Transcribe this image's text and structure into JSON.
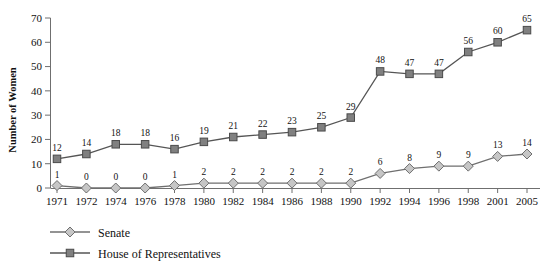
{
  "chart_data": {
    "type": "line",
    "title": "",
    "xlabel": "",
    "ylabel": "Number of Women",
    "ylim": [
      0,
      70
    ],
    "ytick_step": 10,
    "yticks": [
      "0",
      "10",
      "20",
      "30",
      "40",
      "50",
      "60",
      "70"
    ],
    "grid": false,
    "legend_position": "bottom-left",
    "categories": [
      "1971",
      "1972",
      "1974",
      "1976",
      "1978",
      "1980",
      "1982",
      "1984",
      "1986",
      "1988",
      "1990",
      "1992",
      "1994",
      "1996",
      "1998",
      "2001",
      "2005"
    ],
    "series": [
      {
        "name": "Senate",
        "marker": "diamond",
        "marker_fill": "#c6c6c6",
        "marker_stroke": "#6f6f6f",
        "line_color": "#6f6f6f",
        "values": [
          1,
          0,
          0,
          0,
          1,
          2,
          2,
          2,
          2,
          2,
          2,
          6,
          8,
          9,
          9,
          13,
          14
        ],
        "labels": [
          "1",
          "0",
          "0",
          "0",
          "1",
          "2",
          "2",
          "2",
          "2",
          "2",
          "2",
          "6",
          "8",
          "9",
          "9",
          "13",
          "14"
        ]
      },
      {
        "name": "House of Representatives",
        "marker": "square",
        "marker_fill": "#808080",
        "marker_stroke": "#4a4a4a",
        "line_color": "#555555",
        "values": [
          12,
          14,
          18,
          18,
          16,
          19,
          21,
          22,
          23,
          25,
          29,
          48,
          47,
          47,
          56,
          60,
          65
        ],
        "labels": [
          "12",
          "14",
          "18",
          "18",
          "16",
          "19",
          "21",
          "22",
          "23",
          "25",
          "29",
          "48",
          "47",
          "47",
          "56",
          "60",
          "65"
        ]
      }
    ]
  },
  "legend": {
    "items": [
      {
        "label": "Senate"
      },
      {
        "label": "House of Representatives"
      }
    ]
  },
  "axis": {
    "y_title": "Number of Women"
  }
}
